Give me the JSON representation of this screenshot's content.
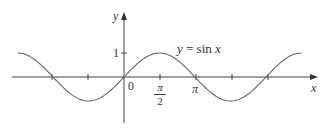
{
  "chart_data": {
    "type": "line",
    "title": "",
    "function_label": "y = sin x",
    "xlabel": "x",
    "ylabel": "y",
    "x_ticks": [
      {
        "value": -3.1416,
        "label": ""
      },
      {
        "value": -1.5708,
        "label": ""
      },
      {
        "value": 0,
        "label": "0"
      },
      {
        "value": 1.5708,
        "label": "π/2"
      },
      {
        "value": 3.1416,
        "label": "π"
      },
      {
        "value": 4.7124,
        "label": ""
      },
      {
        "value": 6.2832,
        "label": ""
      }
    ],
    "y_ticks": [
      {
        "value": 1,
        "label": "1"
      }
    ],
    "xlim": [
      -4.9,
      8.4
    ],
    "ylim": [
      -1.1,
      1.1
    ],
    "series": [
      {
        "name": "y = sin x",
        "x_range": [
          -4.7,
          7.85
        ],
        "formula": "sin(x)",
        "color": "#666666"
      }
    ],
    "grid": false,
    "legend": "none"
  },
  "labels": {
    "y_axis": "y",
    "x_axis": "x",
    "origin": "0",
    "one": "1",
    "pi_num": "π",
    "pi_den": "2",
    "pi": "π",
    "func_y": "y",
    "func_eq": " = sin ",
    "func_x": "x"
  },
  "colors": {
    "axis": "#444444",
    "curve": "#666666"
  }
}
